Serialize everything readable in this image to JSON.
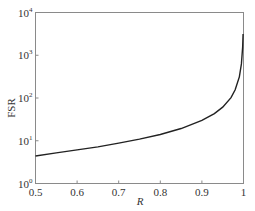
{
  "chart_data": {
    "type": "line",
    "title": "",
    "xlabel": "R",
    "ylabel": "FSR",
    "xlim": [
      0.5,
      1.0
    ],
    "ylim": [
      1,
      10000
    ],
    "yscale": "log",
    "grid": false,
    "legend": null,
    "x_ticks": [
      "0.5",
      "0.6",
      "0.7",
      "0.8",
      "0.9",
      "1"
    ],
    "y_ticks": [
      {
        "base": "10",
        "exp": "0"
      },
      {
        "base": "10",
        "exp": "1"
      },
      {
        "base": "10",
        "exp": "2"
      },
      {
        "base": "10",
        "exp": "3"
      },
      {
        "base": "10",
        "exp": "4"
      }
    ],
    "series": [
      {
        "name": "FSR",
        "color": "#222222",
        "x": [
          0.5,
          0.55,
          0.6,
          0.65,
          0.7,
          0.75,
          0.8,
          0.85,
          0.9,
          0.93,
          0.95,
          0.97,
          0.98,
          0.99,
          0.995,
          0.998,
          0.999
        ],
        "values": [
          4.4,
          5.2,
          6.1,
          7.2,
          8.8,
          10.9,
          14.0,
          19.3,
          29.8,
          43.2,
          61.2,
          101.7,
          155.5,
          312.6,
          627.5,
          1569.2,
          3140.0
        ]
      }
    ]
  }
}
